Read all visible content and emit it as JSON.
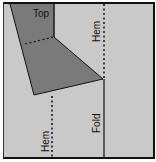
{
  "diagram": {
    "labels": {
      "top": "Top",
      "hem_upper": "Hem",
      "hem_lower": "Hem",
      "fold": "Fold"
    },
    "colors": {
      "background": "#c9c9c9",
      "shape": "#7a7a7a",
      "line": "#111111",
      "outer": "#ffffff"
    }
  }
}
